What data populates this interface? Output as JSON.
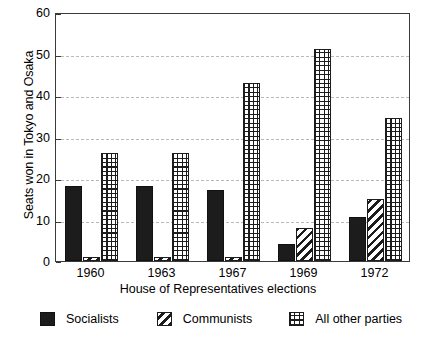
{
  "chart_data": {
    "type": "bar",
    "title": "",
    "subtitle": "",
    "xlabel": "House of Representatives elections",
    "ylabel": "Seats won in Tokyo and Osaka",
    "categories": [
      "1960",
      "1963",
      "1967",
      "1969",
      "1972"
    ],
    "ylim": [
      0,
      60
    ],
    "yticks": [
      0,
      10,
      20,
      30,
      40,
      50,
      60
    ],
    "ytick_labels": [
      "0",
      "10",
      "20",
      "30",
      "40",
      "50",
      "60"
    ],
    "grid": "horizontal-dashed",
    "legend_position": "bottom",
    "series": [
      {
        "name": "Socialists",
        "fill": "solid-black",
        "color": "#1c1c1c",
        "values": [
          18,
          18,
          17,
          4,
          10.5
        ]
      },
      {
        "name": "Communists",
        "fill": "diagonal-hatch",
        "color": "#1c1c1c",
        "values": [
          1,
          1,
          1,
          8,
          15
        ]
      },
      {
        "name": "All other parties",
        "fill": "cross-hatch-grid",
        "color": "#1c1c1c",
        "values": [
          26,
          26,
          43,
          51,
          34.5
        ]
      }
    ]
  },
  "axes": {
    "frame_color": "#3a3a3a",
    "gridline_color": "#b9b9b9"
  }
}
